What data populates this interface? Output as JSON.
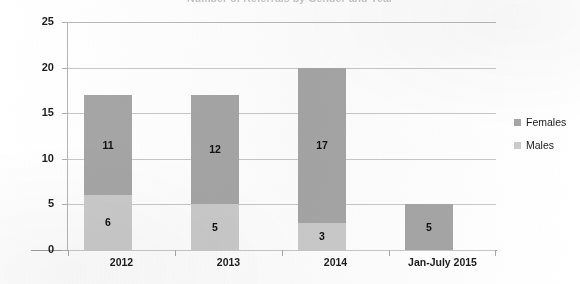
{
  "chart_data": {
    "type": "bar",
    "subtype": "stacked-bar",
    "title": "Number of Referrals by Gender and Year",
    "title_visible": false,
    "xlabel": "",
    "ylabel": "",
    "categories": [
      "2012",
      "2013",
      "2014",
      "Jan-July 2015"
    ],
    "series": [
      {
        "name": "Females",
        "color": "#a6a6a6",
        "values": [
          11,
          12,
          17,
          5
        ]
      },
      {
        "name": "Males",
        "color": "#cbcbcb",
        "values": [
          6,
          5,
          3,
          0
        ]
      }
    ],
    "totals": [
      17,
      17,
      20,
      5
    ],
    "ylim": [
      0,
      25
    ],
    "yticks": [
      0,
      5,
      10,
      15,
      20,
      25
    ],
    "ytick_labels": [
      "0",
      "5",
      "10",
      "15",
      "20",
      "25"
    ],
    "grid": true,
    "grid_axis": "y",
    "legend_position": "right",
    "data_labels": {
      "2012": {
        "Females": "11",
        "Males": "6"
      },
      "2013": {
        "Females": "12",
        "Males": "5"
      },
      "2014": {
        "Females": "17",
        "Males": "3"
      },
      "Jan-July 2015": {
        "Females": "5",
        "Males": ""
      }
    }
  },
  "legend": {
    "items": [
      {
        "label": "Females",
        "color": "#a6a6a6"
      },
      {
        "label": "Males",
        "color": "#cbcbcb"
      }
    ]
  }
}
